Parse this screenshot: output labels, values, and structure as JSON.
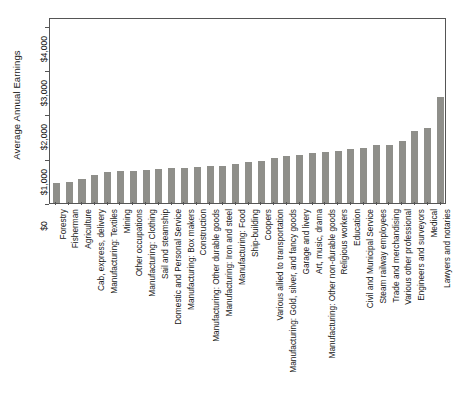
{
  "chart_data": {
    "type": "bar",
    "title": "",
    "subtitle": "",
    "xlabel": "",
    "ylabel": "Average Annual Earnings",
    "ylim": [
      0,
      4200
    ],
    "ytick_values": [
      0,
      1000,
      2000,
      3000,
      4000
    ],
    "ytick_labels": [
      "$0",
      "$1,000",
      "$2,000",
      "$3,000",
      "$4,000"
    ],
    "grid": false,
    "legend": null,
    "bar_color": "#8f8f8a",
    "axis_color": "#555555",
    "categories": [
      "Forestry",
      "Fisherman",
      "Agriculture",
      "Cab, express, delivery",
      "Manufacturing: Textiles",
      "Mining",
      "Other occupations",
      "Manufacturing: Clothing",
      "Sail and steamship",
      "Domestic and Personal Service",
      "Manufacturing: Box makers",
      "Construction",
      "Manufacturing: Other durable goods",
      "Manufacturing: Iron and steel",
      "Manufacturing: Food",
      "Ship-building",
      "Coopers",
      "Various allied to transportation",
      "Manufacturing: Gold, silver, and fancy goods",
      "Garage and livery",
      "Art, music, drama",
      "Manufacturing: Other non-durable goods",
      "Religious workers",
      "Education",
      "Civil and Municipal Service",
      "Steam railway employees",
      "Trade and merchandising",
      "Various other professional",
      "Engineers and surveyors",
      "Medical",
      "Lawyers and notaries"
    ],
    "values": [
      460,
      470,
      545,
      640,
      700,
      720,
      730,
      740,
      770,
      790,
      800,
      815,
      830,
      840,
      890,
      930,
      960,
      1010,
      1060,
      1080,
      1140,
      1160,
      1180,
      1210,
      1250,
      1300,
      1320,
      1390,
      1620,
      1700,
      2400
    ]
  }
}
